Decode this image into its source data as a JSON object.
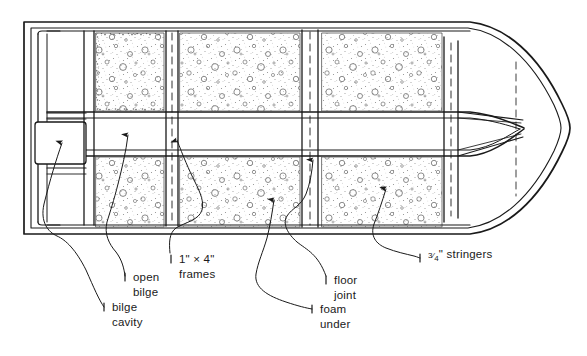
{
  "diagram": {
    "view": "plan",
    "orientation": "stern at left, bow at right",
    "line_color": "#1a1a1a",
    "fill_color": "#ffffff",
    "foam_texture_color": "#8a8a8a",
    "background": "#ffffff"
  },
  "labels": [
    {
      "id": "bilge-cavity",
      "line1": "bilge",
      "line2": "cavity",
      "text_x": 112,
      "text_y": 311,
      "tick_x": 104,
      "points_to": "empty rectangular bilge box at stern, port side"
    },
    {
      "id": "open-bilge",
      "line1": "open",
      "line2": "bilge",
      "text_x": 133,
      "text_y": 281,
      "tick_x": 125,
      "points_to": "open unfoamed bilge compartment"
    },
    {
      "id": "frames",
      "line1": "1\" × 4\"",
      "line2": "frames",
      "text_x": 179,
      "text_y": 263,
      "tick_x": 171,
      "points_to": "transverse 1 inch by 4 inch frame members"
    },
    {
      "id": "floor-joint",
      "line1": "floor",
      "line2": "joint",
      "text_x": 334,
      "text_y": 284,
      "tick_x": 326,
      "points_to": "longitudinal floor joint line"
    },
    {
      "id": "foam-under",
      "line1": "foam",
      "line2": "under",
      "text_x": 320,
      "text_y": 313,
      "tick_x": 312,
      "points_to": "foam flotation packed under the floor"
    },
    {
      "id": "stringers",
      "line1": "¾\" stringers",
      "line2": "",
      "text_x": 428,
      "text_y": 262,
      "tick_x": 420,
      "numerator": "3",
      "denominator": "4",
      "suffix": "\" stringers",
      "points_to": "three quarter inch longitudinal stringers"
    }
  ],
  "structure": {
    "transom": "double-walled band at left end with rounded corners",
    "hull_outline": "double-line hull sides converging to a pointed bow at right",
    "stringers_count": 4,
    "foam_compartments": 6,
    "keel_band": "central longitudinal band between the two floor joint lines"
  }
}
